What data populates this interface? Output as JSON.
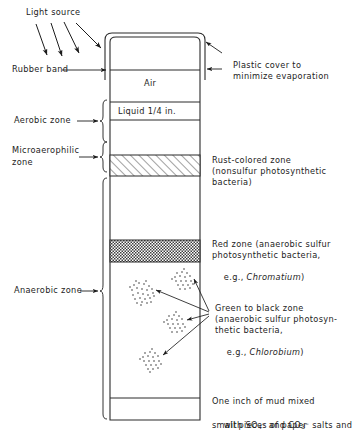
{
  "figure": {
    "labels": {
      "light_source": "Light source",
      "rubber_band": "Rubber band",
      "aerobic_zone": "Aerobic zone",
      "microaerophilic_zone_l1": "Microaerophilic",
      "microaerophilic_zone_l2": "zone",
      "anaerobic_zone": "Anaerobic zone",
      "air": "Air",
      "liquid": "Liquid 1/4 in.",
      "plastic_cover_l1": "Plastic cover to",
      "plastic_cover_l2": "minimize evaporation",
      "rust_zone_l1": "Rust-colored zone",
      "rust_zone_l2": "(nonsulfur photosynthetic",
      "rust_zone_l3": "bacteria)",
      "red_zone_l1": "Red zone (anaerobic sulfur",
      "red_zone_l2": "photosynthetic bacteria,",
      "red_zone_l3_pre": "e.g., ",
      "red_zone_l3_genus": "Chromatium",
      "red_zone_l3_post": ")",
      "green_zone_l1": "Green to black zone",
      "green_zone_l2": "(anaerobic sulfur photosyn-",
      "green_zone_l3": "thetic bacteria,",
      "green_zone_l4_pre": "e.g., ",
      "green_zone_l4_genus": "Chlorobium",
      "green_zone_l4_post": ")",
      "mud_l1": "One inch of mud mixed",
      "mud_l2_a": "with SO",
      "mud_l2_sub1": "4",
      "mud_l2_sup1": "–",
      "mud_l2_b": " and CO",
      "mud_l2_sub2": "3",
      "mud_l2_sup2": "–",
      "mud_l2_c": " salts and",
      "mud_l3": "small pieces of paper"
    },
    "colors": {
      "ink": "#1c1c1c",
      "line": "#2b2b2b",
      "hatch": "#3a3a3a",
      "background": "#ffffff"
    },
    "geometry": {
      "cover_left": 105,
      "cover_right": 205,
      "cover_top": 33,
      "cover_bottom": 80,
      "jar_left": 110,
      "jar_right": 200,
      "jar_top": 37,
      "jar_bottom": 420,
      "rubber_band_y": 70,
      "liquid_top": 102,
      "liquid_bottom": 120,
      "rust_top": 155,
      "rust_bottom": 176,
      "red_top": 240,
      "red_bottom": 262,
      "mud_line": 398
    },
    "clusters": [
      {
        "cx": 143,
        "cy": 292,
        "r": 11
      },
      {
        "cx": 185,
        "cy": 281,
        "r": 10
      },
      {
        "cx": 177,
        "cy": 324,
        "r": 10
      },
      {
        "cx": 154,
        "cy": 362,
        "r": 11
      }
    ],
    "light_rays": [
      {
        "x1": 38,
        "y1": 23,
        "x2": 49,
        "y2": 56
      },
      {
        "x1": 52,
        "y1": 22,
        "x2": 63,
        "y2": 57
      },
      {
        "x1": 64,
        "y1": 22,
        "x2": 78,
        "y2": 54
      },
      {
        "x1": 76,
        "y1": 24,
        "x2": 102,
        "y2": 48
      }
    ]
  }
}
